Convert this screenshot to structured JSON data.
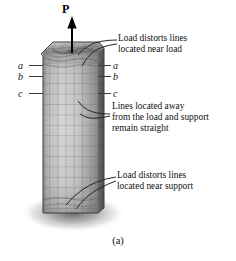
{
  "figure": {
    "caption": "(a)",
    "load_label": "P",
    "load_arrow": "up-arrow-icon"
  },
  "annotations": [
    {
      "id": "near-load",
      "lines": [
        "Load distorts lines",
        "located near load"
      ]
    },
    {
      "id": "away-from-load",
      "lines": [
        "Lines located away",
        "from the load and support",
        "remain straight"
      ]
    },
    {
      "id": "near-support",
      "lines": [
        "Load distorts lines",
        "located near support"
      ]
    }
  ],
  "section_labels": {
    "left": [
      "a",
      "b",
      "c"
    ],
    "right": [
      "a",
      "b",
      "c"
    ]
  },
  "colors": {
    "background": "#ffffff",
    "text": "#111111",
    "column_light": "#cfcfcf",
    "column_mid": "#a8a8a8",
    "column_dark": "#6f6f6f",
    "grid_line": "#5e5e5e",
    "shadow": "#8c8c8c",
    "leader_line": "#2b2b2b"
  }
}
